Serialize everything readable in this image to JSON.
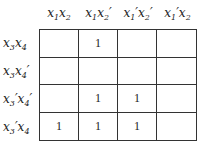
{
  "kmap": {
    "columns": [
      {
        "var1": "x",
        "sub1": "1",
        "p1": "",
        "var2": "x",
        "sub2": "2",
        "p2": ""
      },
      {
        "var1": "x",
        "sub1": "1",
        "p1": "",
        "var2": "x",
        "sub2": "2",
        "p2": "′"
      },
      {
        "var1": "x",
        "sub1": "1",
        "p1": "′",
        "var2": "x",
        "sub2": "2",
        "p2": "′"
      },
      {
        "var1": "x",
        "sub1": "1",
        "p1": "′",
        "var2": "x",
        "sub2": "2",
        "p2": ""
      }
    ],
    "rows": [
      {
        "var1": "x",
        "sub1": "3",
        "p1": "",
        "var2": "x",
        "sub2": "4",
        "p2": ""
      },
      {
        "var1": "x",
        "sub1": "3",
        "p1": "",
        "var2": "x",
        "sub2": "4",
        "p2": "′"
      },
      {
        "var1": "x",
        "sub1": "3",
        "p1": "′",
        "var2": "x",
        "sub2": "4",
        "p2": "′"
      },
      {
        "var1": "x",
        "sub1": "3",
        "p1": "′",
        "var2": "x",
        "sub2": "4",
        "p2": ""
      }
    ],
    "cells": [
      [
        "",
        "1",
        "",
        ""
      ],
      [
        "",
        "",
        "",
        ""
      ],
      [
        "",
        "1",
        "1",
        ""
      ],
      [
        "1",
        "1",
        "1",
        ""
      ]
    ]
  }
}
